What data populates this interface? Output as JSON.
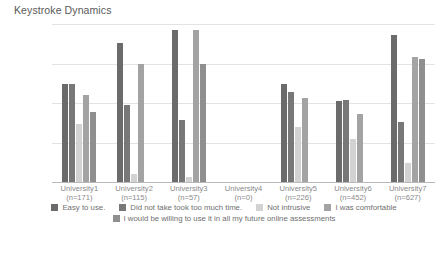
{
  "chart_data": {
    "type": "bar",
    "title": "Keystroke Dynamics",
    "xlabel": "",
    "ylabel": "",
    "ylim": [
      0,
      100
    ],
    "yticks": [
      "0.0%",
      "25.0%",
      "50.0%",
      "75.0%",
      "100.0%"
    ],
    "ytick_values": [
      0,
      25,
      50,
      75,
      100
    ],
    "grid": true,
    "legend_position": "bottom",
    "categories": [
      "University1\n(n=171)",
      "University2\n(n=115)",
      "University3\n(n=57)",
      "University4\n(n=0)",
      "University5\n(n=226)",
      "University6\n(n=452)",
      "University7\n(n=627)"
    ],
    "category_names": [
      "University1",
      "University2",
      "University3",
      "University4",
      "University5",
      "University6",
      "University7"
    ],
    "category_counts": [
      "(n=171)",
      "(n=115)",
      "(n=57)",
      "(n=0)",
      "(n=226)",
      "(n=452)",
      "(n=627)"
    ],
    "series": [
      {
        "name": "Easy to use.",
        "color": "#6b6b6b",
        "values": [
          62,
          88,
          96,
          0,
          62,
          51,
          93
        ]
      },
      {
        "name": "Did not take took too much time.",
        "color": "#787878",
        "values": [
          62,
          49,
          39,
          0,
          57,
          52,
          38
        ]
      },
      {
        "name": "Not intrusive",
        "color": "#d2d2d2",
        "values": [
          37,
          5,
          3,
          0,
          35,
          27,
          12
        ]
      },
      {
        "name": "I was comfortable",
        "color": "#a3a3a3",
        "values": [
          55,
          75,
          96,
          0,
          53,
          43,
          79
        ]
      },
      {
        "name": "I would be willing to use it in all my future online assessments",
        "color": "#8f8f8f",
        "values": [
          44,
          0,
          75,
          0,
          0,
          0,
          78
        ]
      }
    ]
  },
  "legend": {
    "row1": [
      "Easy to use.",
      "Did not take took too much time.",
      "Not intrusive",
      "I was comfortable"
    ],
    "row2": [
      "I would be willing to use it in all my future online assessments"
    ]
  }
}
